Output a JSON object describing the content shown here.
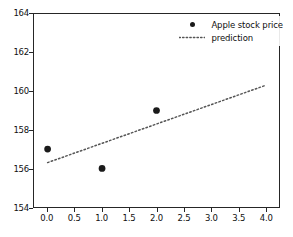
{
  "chart_data": {
    "type": "scatter",
    "title": "",
    "xlabel": "",
    "ylabel": "",
    "xlim": [
      -0.25,
      4.25
    ],
    "ylim": [
      154,
      164
    ],
    "grid": false,
    "legend_position": "upper right",
    "xticks": [
      "0.0",
      "0.5",
      "1.0",
      "1.5",
      "2.0",
      "2.5",
      "3.0",
      "3.5",
      "4.0"
    ],
    "xtick_values": [
      0.0,
      0.5,
      1.0,
      1.5,
      2.0,
      2.5,
      3.0,
      3.5,
      4.0
    ],
    "yticks": [
      "154",
      "156",
      "158",
      "160",
      "162",
      "164"
    ],
    "ytick_values": [
      154,
      156,
      158,
      160,
      162,
      164
    ],
    "series": [
      {
        "name": "Apple stock price",
        "type": "scatter",
        "marker": "circle",
        "color": "#1a1a1a",
        "x": [
          0,
          1,
          2
        ],
        "y": [
          157,
          156,
          159
        ]
      },
      {
        "name": "prediction",
        "type": "line",
        "linestyle": "dotted",
        "color": "#555555",
        "x": [
          0,
          4
        ],
        "y": [
          156.3,
          160.3
        ]
      }
    ]
  },
  "legend": {
    "entries": [
      {
        "label": "Apple stock price",
        "key": "marker-dot"
      },
      {
        "label": "prediction",
        "key": "dotted-line"
      }
    ]
  },
  "colors": {
    "marker": "#1a1a1a",
    "prediction_line": "#555555",
    "axis": "#262626",
    "background": "#ffffff"
  }
}
